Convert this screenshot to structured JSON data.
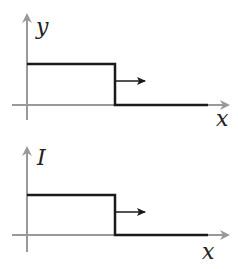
{
  "diagrams": [
    {
      "id": "top",
      "y_axis_label": "y",
      "x_axis_label": "x",
      "description": "Step profile of height y propagating in +x direction"
    },
    {
      "id": "bottom",
      "y_axis_label": "I",
      "x_axis_label": "x",
      "description": "Step profile of current I propagating in +x direction"
    }
  ],
  "colors": {
    "axis": "#999999",
    "curve": "#1a1a1a",
    "label": "#222222"
  }
}
